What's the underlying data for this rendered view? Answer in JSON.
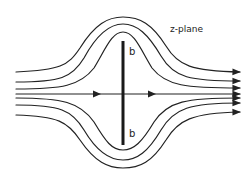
{
  "diagram": {
    "title": "z-plane",
    "plate_labels": {
      "top": "b",
      "bottom": "b"
    },
    "colors": {
      "ink": "#222222",
      "background": "#ffffff"
    },
    "plate": {
      "x": 123,
      "y_top": 41,
      "y_bottom": 145,
      "width": 3
    },
    "center_line_y": 94,
    "streamlines": [
      {
        "name": "upper-outer",
        "left_y": 72,
        "peak_y": 17,
        "right_y": 72
      },
      {
        "name": "upper-middle",
        "left_y": 82,
        "peak_y": 24,
        "right_y": 81
      },
      {
        "name": "upper-inner",
        "left_y": 89,
        "peak_y": 32,
        "right_y": 88
      },
      {
        "name": "center",
        "left_y": 94,
        "right_y": 94
      },
      {
        "name": "lower-inner",
        "left_y": 98,
        "peak_y": 150,
        "right_y": 98
      },
      {
        "name": "lower-middle",
        "left_y": 105,
        "peak_y": 160,
        "right_y": 103
      },
      {
        "name": "lower-outer",
        "left_y": 115,
        "peak_y": 168,
        "right_y": 112
      }
    ]
  }
}
